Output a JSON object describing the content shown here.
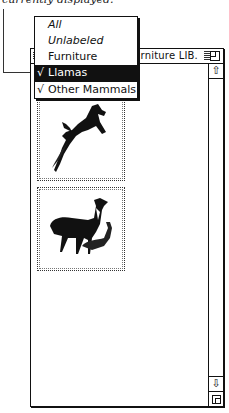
{
  "caption": "currently displayed.",
  "window": {
    "title": "rniture LIB.",
    "thumbnails": [
      {
        "label": "leaping-gazelle-image"
      },
      {
        "label": "llamas-image"
      }
    ],
    "scrollbar": {
      "up_arrow": "⇧",
      "down_arrow": "⇩"
    }
  },
  "menu": {
    "items": [
      {
        "label": "All",
        "italic": true,
        "checked": false,
        "selected": false
      },
      {
        "label": "Unlabeled",
        "italic": true,
        "checked": false,
        "selected": false
      },
      {
        "label": "Furniture",
        "italic": false,
        "checked": false,
        "selected": false
      },
      {
        "label": "Llamas",
        "italic": false,
        "checked": true,
        "selected": true
      },
      {
        "label": "Other Mammals",
        "italic": false,
        "checked": true,
        "selected": false
      }
    ],
    "check_glyph": "√"
  }
}
